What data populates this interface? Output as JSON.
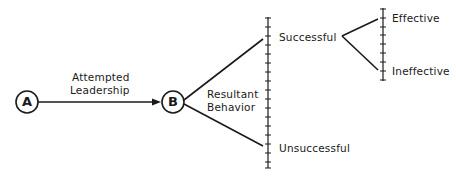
{
  "diagram": {
    "nodes": [
      {
        "id": "A",
        "label": "A"
      },
      {
        "id": "B",
        "label": "B"
      }
    ],
    "edge_label": {
      "line1": "Attempted",
      "line2": "Leadership"
    },
    "resultant": {
      "line1": "Resultant",
      "line2": "Behavior"
    },
    "outcomes": {
      "top": "Successful",
      "bottom": "Unsuccessful"
    },
    "effectiveness": {
      "top": "Effective",
      "bottom": "Ineffective"
    },
    "colors": {
      "line": "#1a1a1a",
      "background": "#ffffff"
    }
  }
}
